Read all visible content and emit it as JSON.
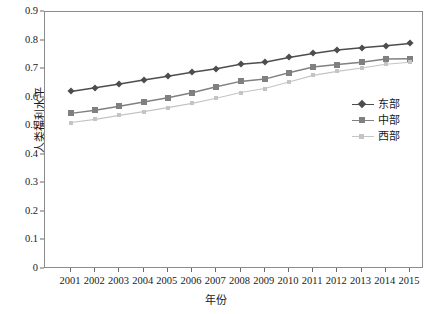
{
  "chart_data": {
    "type": "line",
    "title": "",
    "xlabel": "年份",
    "ylabel": "人类福利水平",
    "categories": [
      "2001",
      "2002",
      "2003",
      "2004",
      "2005",
      "2006",
      "2007",
      "2008",
      "2009",
      "2010",
      "2011",
      "2012",
      "2013",
      "2014",
      "2015"
    ],
    "x": [
      2001,
      2002,
      2003,
      2004,
      2005,
      2006,
      2007,
      2008,
      2009,
      2010,
      2011,
      2012,
      2013,
      2014,
      2015
    ],
    "ylim": [
      0,
      0.9
    ],
    "yticks": [
      "0",
      "0.1",
      "0.2",
      "0.3",
      "0.4",
      "0.5",
      "0.6",
      "0.7",
      "0.8",
      "0.9"
    ],
    "ytick_values": [
      0,
      0.1,
      0.2,
      0.3,
      0.4,
      0.5,
      0.6,
      0.7,
      0.8,
      0.9
    ],
    "grid": false,
    "legend_position": "right-middle",
    "series": [
      {
        "name": "东部",
        "marker": "diamond",
        "color": "#4d4d4d",
        "values": [
          0.622,
          0.635,
          0.648,
          0.662,
          0.675,
          0.689,
          0.701,
          0.717,
          0.724,
          0.741,
          0.755,
          0.767,
          0.775,
          0.782,
          0.79
        ]
      },
      {
        "name": "中部",
        "marker": "square",
        "color": "#808080",
        "values": [
          0.545,
          0.556,
          0.57,
          0.585,
          0.6,
          0.617,
          0.638,
          0.657,
          0.665,
          0.687,
          0.707,
          0.716,
          0.724,
          0.735,
          0.736
        ]
      },
      {
        "name": "西部",
        "marker": "triangle",
        "color": "#c4c4c4",
        "values": [
          0.513,
          0.524,
          0.538,
          0.551,
          0.565,
          0.58,
          0.598,
          0.618,
          0.632,
          0.655,
          0.678,
          0.692,
          0.704,
          0.717,
          0.724
        ]
      }
    ]
  },
  "legend": {
    "items": [
      {
        "label": "东部"
      },
      {
        "label": "中部"
      },
      {
        "label": "西部"
      }
    ]
  },
  "axes": {
    "y_title": "人类福利水平",
    "x_title": "年份"
  },
  "colors": {
    "series_east": "#4d4d4d",
    "series_central": "#808080",
    "series_west": "#c4c4c4",
    "frame": "#8c8c8c",
    "background": "#ffffff",
    "text": "#1a1a1a"
  }
}
